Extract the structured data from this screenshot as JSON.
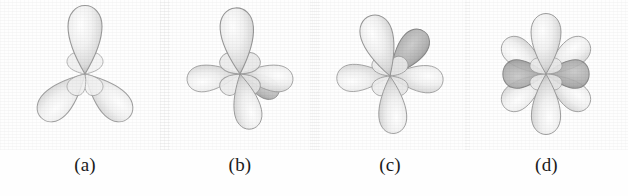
{
  "figure": {
    "caption_style": "lettered",
    "background_color": "#fefefe",
    "ink_color": "#1b1b1b",
    "panel_count": 4
  },
  "panels": [
    {
      "id": "panel-a",
      "label": "(a)",
      "lobe_count": 3,
      "description": "three teardrop lobes in a trigonal planar arrangement, one pointing up and two pointing down-left and down-right",
      "center_x": 85,
      "center_y": 72,
      "lobes": [
        {
          "angle_deg": -90,
          "length": 62,
          "width": 33,
          "shade": "light"
        },
        {
          "angle_deg": 40,
          "length": 62,
          "width": 31,
          "shade": "light"
        },
        {
          "angle_deg": 140,
          "length": 62,
          "width": 31,
          "shade": "light"
        }
      ],
      "inner_rosette_petals": 4
    },
    {
      "id": "panel-b",
      "label": "(b)",
      "lobe_count": 4,
      "description": "four teardrop lobes: up, left, right and down-front, tetrahedral-like projection",
      "center_x": 240,
      "center_y": 72,
      "lobes": [
        {
          "angle_deg": -90,
          "length": 60,
          "width": 32,
          "shade": "light"
        },
        {
          "angle_deg": 172,
          "length": 50,
          "width": 30,
          "shade": "light"
        },
        {
          "angle_deg": 8,
          "length": 50,
          "width": 30,
          "shade": "light"
        },
        {
          "angle_deg": 78,
          "length": 52,
          "width": 31,
          "shade": "light"
        },
        {
          "angle_deg": 28,
          "length": 34,
          "width": 20,
          "shade": "dark"
        }
      ],
      "inner_rosette_petals": 4
    },
    {
      "id": "panel-c",
      "label": "(c)",
      "lobe_count": 5,
      "description": "five lobes: up-left, an overlapping darker lobe tilted up-right behind, left, right and down",
      "center_x": 390,
      "center_y": 72,
      "lobes": [
        {
          "angle_deg": -108,
          "length": 58,
          "width": 31,
          "shade": "light"
        },
        {
          "angle_deg": -52,
          "length": 54,
          "width": 30,
          "shade": "dark"
        },
        {
          "angle_deg": 178,
          "length": 52,
          "width": 29,
          "shade": "light"
        },
        {
          "angle_deg": 6,
          "length": 52,
          "width": 29,
          "shade": "light"
        },
        {
          "angle_deg": 86,
          "length": 56,
          "width": 30,
          "shade": "light"
        }
      ],
      "inner_rosette_petals": 4
    },
    {
      "id": "panel-d",
      "label": "(d)",
      "lobe_count": 6,
      "description": "six lobes in a flower arrangement: up, down, upper-left, upper-right, lower-left, lower-right, with two dark horizontal lobes through the middle",
      "center_x": 545,
      "center_y": 72,
      "lobes": [
        {
          "angle_deg": -90,
          "length": 58,
          "width": 32,
          "shade": "light"
        },
        {
          "angle_deg": 90,
          "length": 58,
          "width": 32,
          "shade": "light"
        },
        {
          "angle_deg": -150,
          "length": 52,
          "width": 30,
          "shade": "light"
        },
        {
          "angle_deg": -30,
          "length": 52,
          "width": 30,
          "shade": "light"
        },
        {
          "angle_deg": 150,
          "length": 52,
          "width": 30,
          "shade": "light"
        },
        {
          "angle_deg": 30,
          "length": 52,
          "width": 30,
          "shade": "light"
        },
        {
          "angle_deg": 180,
          "length": 46,
          "width": 20,
          "shade": "dark"
        },
        {
          "angle_deg": 0,
          "length": 46,
          "width": 20,
          "shade": "dark"
        }
      ],
      "inner_rosette_petals": 4
    }
  ],
  "palette": {
    "lobe_light_fill": "#e9e9e9",
    "lobe_light_highlight": "#fafafa",
    "lobe_light_edge": "#9a9a9a",
    "lobe_dark_fill": "#b9b9b9",
    "lobe_dark_edge": "#7c7c7c",
    "label_color": "#1b1b1b",
    "background": "#fefefe"
  }
}
